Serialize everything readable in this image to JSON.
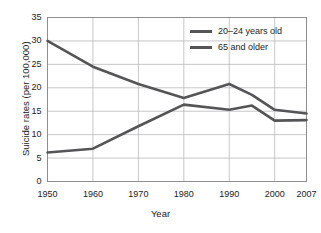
{
  "chart_data": {
    "type": "line",
    "title": "",
    "xlabel": "Year",
    "ylabel": "Suicide rates (per 100,000)",
    "x": [
      1950,
      1960,
      1970,
      1980,
      1990,
      1995,
      2000,
      2007
    ],
    "xtick_labels": [
      "1950",
      "1960",
      "1970",
      "1980",
      "1990",
      "2000",
      "2007"
    ],
    "xtick_values": [
      1950,
      1960,
      1970,
      1980,
      1990,
      2000,
      2007
    ],
    "xlim": [
      1950,
      2007
    ],
    "ytick_labels": [
      "0",
      "5",
      "10",
      "15",
      "20",
      "25",
      "30",
      "35"
    ],
    "ytick_values": [
      0,
      5,
      10,
      15,
      20,
      25,
      30,
      35
    ],
    "ylim": [
      0,
      35
    ],
    "grid": true,
    "legend_position": "top-right",
    "series": [
      {
        "name": "20–24 years old",
        "color": "#555558",
        "x": [
          1950,
          1960,
          1970,
          1980,
          1990,
          1995,
          2000,
          2007
        ],
        "values": [
          6.2,
          7.0,
          11.8,
          16.4,
          15.3,
          16.2,
          13.0,
          13.1
        ]
      },
      {
        "name": "65 and older",
        "color": "#555558",
        "x": [
          1950,
          1960,
          1970,
          1980,
          1990,
          1995,
          2000,
          2007
        ],
        "values": [
          30.0,
          24.5,
          20.8,
          17.8,
          20.8,
          18.5,
          15.3,
          14.5
        ]
      }
    ]
  },
  "legend": {
    "items": [
      {
        "label": "20–24 years old"
      },
      {
        "label": "65 and older"
      }
    ]
  },
  "axes": {
    "x_title": "Year",
    "y_title": "Suicide rates (per 100,000)",
    "y_ticks": [
      "35",
      "30",
      "25",
      "20",
      "15",
      "10",
      "5",
      "0"
    ],
    "x_ticks": [
      "1950",
      "1960",
      "1970",
      "1980",
      "1990",
      "2000",
      "2007"
    ]
  },
  "colors": {
    "line": "#555558",
    "grid": "#b9b9bb",
    "frame": "#8e8e90",
    "text": "#1b1b1b",
    "background": "#ffffff"
  }
}
